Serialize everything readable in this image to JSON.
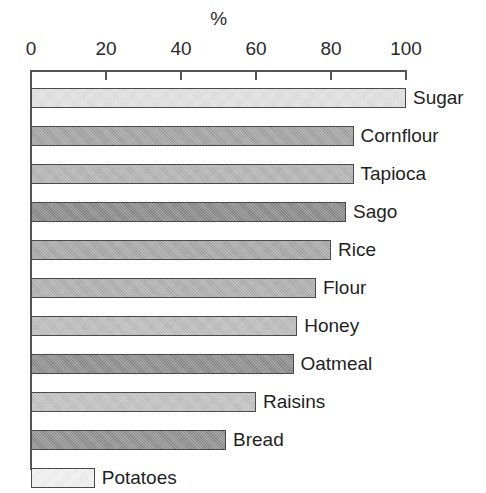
{
  "chart_data": {
    "type": "bar",
    "orientation": "horizontal",
    "title": "",
    "xlabel": "%",
    "ylabel": "",
    "xlim": [
      0,
      100
    ],
    "xticks": [
      0,
      20,
      40,
      60,
      80,
      100
    ],
    "grid": false,
    "legend": "none",
    "categories": [
      "Sugar",
      "Cornflour",
      "Tapioca",
      "Sago",
      "Rice",
      "Flour",
      "Honey",
      "Oatmeal",
      "Raisins",
      "Bread",
      "Potatoes"
    ],
    "values": [
      100,
      86,
      86,
      84,
      80,
      76,
      71,
      70,
      60,
      52,
      17
    ],
    "bar_colors": [
      "#e2e2e2",
      "#a3a3a3",
      "#b4b4b4",
      "#8a8a8a",
      "#a8a8a8",
      "#b0b0b0",
      "#bdbdbd",
      "#8d8d8d",
      "#c2c2c2",
      "#909090",
      "#f2f2f2"
    ],
    "bar_border_color": "#4a4a4a",
    "axis_color": "#555555",
    "background_color": "#ffffff",
    "bars": [
      {
        "label": "Sugar",
        "value": 100,
        "color": "#e2e2e2"
      },
      {
        "label": "Cornflour",
        "value": 86,
        "color": "#a3a3a3"
      },
      {
        "label": "Tapioca",
        "value": 86,
        "color": "#b4b4b4"
      },
      {
        "label": "Sago",
        "value": 84,
        "color": "#8a8a8a"
      },
      {
        "label": "Rice",
        "value": 80,
        "color": "#a8a8a8"
      },
      {
        "label": "Flour",
        "value": 76,
        "color": "#b0b0b0"
      },
      {
        "label": "Honey",
        "value": 71,
        "color": "#bdbdbd"
      },
      {
        "label": "Oatmeal",
        "value": 70,
        "color": "#8d8d8d"
      },
      {
        "label": "Raisins",
        "value": 60,
        "color": "#c2c2c2"
      },
      {
        "label": "Bread",
        "value": 52,
        "color": "#909090"
      },
      {
        "label": "Potatoes",
        "value": 17,
        "color": "#f2f2f2"
      }
    ]
  },
  "axis": {
    "title": "%",
    "tick_labels": [
      "0",
      "20",
      "40",
      "60",
      "80",
      "100"
    ]
  },
  "geometry": {
    "origin_x": 31,
    "px_per_unit": 3.75,
    "top_y": 70,
    "row_height": 38,
    "first_bar_y": 88,
    "bar_height": 20
  }
}
